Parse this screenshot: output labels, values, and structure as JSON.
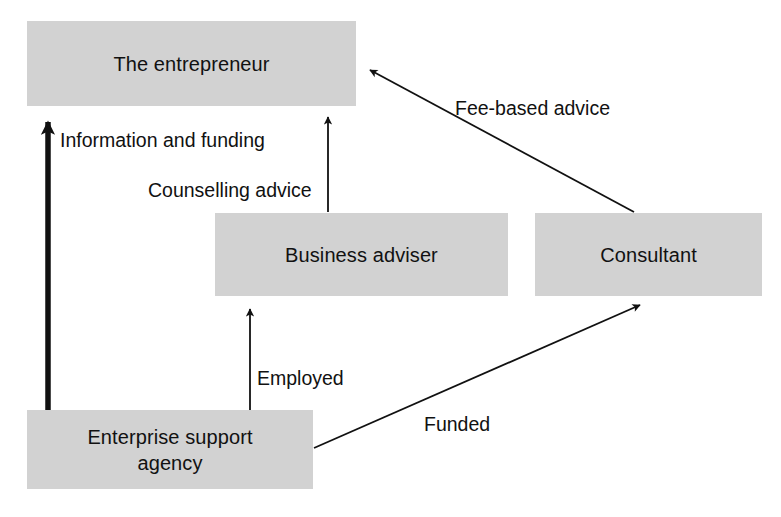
{
  "diagram": {
    "colors": {
      "node_fill": "#d2d2d2",
      "line": "#111111",
      "background": "#ffffff",
      "text": "#111111"
    },
    "nodes": [
      {
        "id": "entrepreneur",
        "label": "The entrepreneur",
        "x": 27,
        "y": 21,
        "width": 329,
        "height": 85
      },
      {
        "id": "business-adviser",
        "label": "Business adviser",
        "x": 215,
        "y": 213,
        "width": 293,
        "height": 83
      },
      {
        "id": "consultant",
        "label": "Consultant",
        "x": 535,
        "y": 213,
        "width": 227,
        "height": 83
      },
      {
        "id": "enterprise-support-agency",
        "label": "Enterprise support agency",
        "x": 27,
        "y": 410,
        "width": 286,
        "height": 79
      }
    ],
    "edges": [
      {
        "id": "information-and-funding",
        "label": "Information and funding",
        "from": "enterprise-support-agency",
        "to": "entrepreneur",
        "style": "thick",
        "label_x": 60,
        "label_y": 129
      },
      {
        "id": "counselling-advice",
        "label": "Counselling advice",
        "from": "business-adviser",
        "to": "entrepreneur",
        "style": "thin",
        "label_x": 148,
        "label_y": 179
      },
      {
        "id": "fee-based-advice",
        "label": "Fee-based advice",
        "from": "consultant",
        "to": "entrepreneur",
        "style": "thin",
        "label_x": 455,
        "label_y": 97
      },
      {
        "id": "employed",
        "label": "Employed",
        "from": "enterprise-support-agency",
        "to": "business-adviser",
        "style": "thin",
        "label_x": 257,
        "label_y": 367
      },
      {
        "id": "funded",
        "label": "Funded",
        "from": "enterprise-support-agency",
        "to": "consultant",
        "style": "thin",
        "label_x": 424,
        "label_y": 413
      }
    ]
  }
}
